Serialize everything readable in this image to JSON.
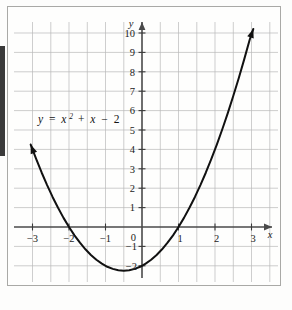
{
  "figure": {
    "name": "parabola-graph",
    "background_color": "#fefefd",
    "frame_color": "#a9a9a6",
    "curve_color": "#111111",
    "grid_color": "#b9b9b9",
    "axis_color": "#4a4a4a"
  },
  "equation": {
    "lhs": "y",
    "equals": "=",
    "var": "x",
    "exponent": "2",
    "plus": "+",
    "var2": "x",
    "minus": "−",
    "constant": "2",
    "full": "y = x² + x − 2"
  },
  "axes": {
    "x_label": "x",
    "y_label": "y",
    "x_ticks": [
      "−3",
      "−2",
      "−1",
      "1",
      "2",
      "3"
    ],
    "y_ticks": [
      "10",
      "9",
      "8",
      "7",
      "6",
      "5",
      "4",
      "3",
      "2",
      "1",
      "−1",
      "−2"
    ],
    "origin_label": "0"
  },
  "chart_data": {
    "type": "line",
    "xlabel": "x",
    "ylabel": "y",
    "xlim": [
      -3.3,
      3.2
    ],
    "ylim": [
      -2.6,
      10.6
    ],
    "grid": true,
    "legend": "none",
    "annotations": [
      {
        "text": "y = x² + x − 2",
        "x": -2.25,
        "y": 5.4
      }
    ],
    "xticks": [
      -3,
      -2,
      -1,
      0,
      1,
      2,
      3
    ],
    "yticks": [
      -2,
      -1,
      0,
      1,
      2,
      3,
      4,
      5,
      6,
      7,
      8,
      9,
      10
    ],
    "grid_minor_step_x": 0.5,
    "grid_minor_step_y": 1,
    "vertex": {
      "x": -0.5,
      "y": -2.25
    },
    "roots": [
      -2,
      1
    ],
    "y_intercept": -2,
    "series": [
      {
        "name": "y = x^2 + x - 2",
        "x": [
          -3.05,
          -2.9,
          -2.75,
          -2.6,
          -2.45,
          -2.3,
          -2.15,
          -2.0,
          -1.85,
          -1.7,
          -1.55,
          -1.4,
          -1.25,
          -1.1,
          -0.95,
          -0.8,
          -0.65,
          -0.5,
          -0.35,
          -0.2,
          -0.05,
          0.1,
          0.25,
          0.4,
          0.55,
          0.7,
          0.85,
          1.0,
          1.15,
          1.3,
          1.45,
          1.6,
          1.75,
          1.9,
          2.05,
          2.2,
          2.35,
          2.5,
          2.65,
          2.8,
          2.95,
          3.05
        ],
        "y": [
          4.25,
          3.51,
          2.81,
          2.16,
          1.55,
          0.99,
          0.47,
          0.0,
          -0.43,
          -0.81,
          -1.15,
          -1.44,
          -1.69,
          -1.89,
          -2.05,
          -2.16,
          -2.23,
          -2.25,
          -2.23,
          -2.16,
          -2.05,
          -1.89,
          -1.69,
          -1.44,
          -1.15,
          -0.81,
          -0.43,
          0.0,
          0.47,
          0.99,
          1.55,
          2.16,
          2.81,
          3.51,
          4.25,
          5.04,
          5.87,
          6.75,
          7.67,
          8.64,
          9.65,
          10.21
        ],
        "arrow_start": true,
        "arrow_end": true
      }
    ]
  }
}
